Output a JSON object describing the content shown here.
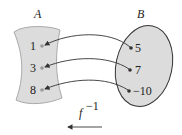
{
  "diagram": {
    "type": "mapping",
    "title": "",
    "sets": {
      "A": {
        "label": "A",
        "elements": [
          "1",
          "3",
          "8"
        ]
      },
      "B": {
        "label": "B",
        "elements": [
          "5",
          "7",
          "−10"
        ]
      }
    },
    "mappings": [
      {
        "from": "5",
        "to": "1"
      },
      {
        "from": "7",
        "to": "3"
      },
      {
        "from": "−10",
        "to": "8"
      }
    ],
    "function_label": "f",
    "function_superscript": "−1",
    "direction": "B to A",
    "colors": {
      "fill": "#dcdcdc",
      "stroke": "#333333",
      "point": "#333333",
      "point_A": "#999999"
    }
  }
}
